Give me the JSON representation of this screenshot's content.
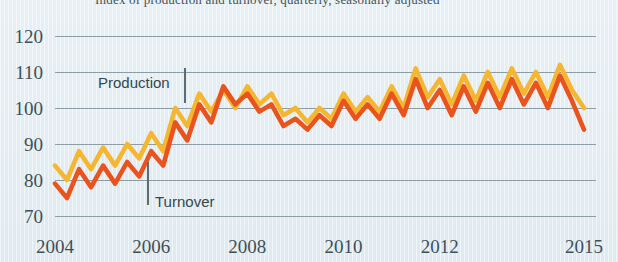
{
  "title_clipped": "Index of production and turnover, quarterly, seasonally adjusted",
  "colors": {
    "production": "#f5b731",
    "turnover": "#e8531e",
    "grid": "#8d9da6",
    "text": "#3e505a",
    "background": "#e4eef3"
  },
  "annotations": [
    {
      "label": "Production",
      "x": 98,
      "y": 88
    },
    {
      "label": "Turnover",
      "x": 155,
      "y": 207
    }
  ],
  "axis": {
    "y_ticks": [
      "120",
      "110",
      "100",
      "90",
      "80",
      "70"
    ],
    "x_ticks": [
      "2004",
      "2006",
      "2008",
      "2010",
      "2012",
      "2015"
    ]
  },
  "chart_data": {
    "type": "line",
    "title": "Index of production and turnover, quarterly, seasonally adjusted",
    "xlabel": "",
    "ylabel": "Index",
    "ylim": [
      70,
      120
    ],
    "xlim": [
      2004.0,
      2015.25
    ],
    "grid": true,
    "gridlines": [
      70,
      80,
      90,
      100,
      110,
      120
    ],
    "legend_position": "inline-annotation",
    "x": [
      2004.0,
      2004.25,
      2004.5,
      2004.75,
      2005.0,
      2005.25,
      2005.5,
      2005.75,
      2006.0,
      2006.25,
      2006.5,
      2006.75,
      2007.0,
      2007.25,
      2007.5,
      2007.75,
      2008.0,
      2008.25,
      2008.5,
      2008.75,
      2009.0,
      2009.25,
      2009.5,
      2009.75,
      2010.0,
      2010.25,
      2010.5,
      2010.75,
      2011.0,
      2011.25,
      2011.5,
      2011.75,
      2012.0,
      2012.25,
      2012.5,
      2012.75,
      2013.0,
      2013.25,
      2013.5,
      2013.75,
      2014.0,
      2014.25,
      2014.5,
      2014.75,
      2015.0
    ],
    "series": [
      {
        "name": "Production",
        "color": "#f5b731",
        "values": [
          84,
          80,
          88,
          83,
          89,
          84,
          90,
          86,
          93,
          88,
          100,
          95,
          104,
          99,
          105,
          100,
          106,
          101,
          104,
          98,
          100,
          96,
          100,
          97,
          104,
          99,
          103,
          99,
          106,
          100,
          111,
          103,
          108,
          101,
          109,
          102,
          110,
          103,
          111,
          104,
          110,
          103,
          112,
          105,
          100
        ]
      },
      {
        "name": "Turnover",
        "color": "#e8531e",
        "values": [
          79,
          75,
          83,
          78,
          84,
          79,
          85,
          81,
          88,
          84,
          96,
          91,
          101,
          96,
          106,
          101,
          104,
          99,
          101,
          95,
          97,
          94,
          98,
          95,
          102,
          97,
          101,
          97,
          104,
          98,
          108,
          100,
          105,
          98,
          106,
          99,
          107,
          100,
          108,
          101,
          107,
          100,
          109,
          102,
          94
        ]
      }
    ]
  }
}
